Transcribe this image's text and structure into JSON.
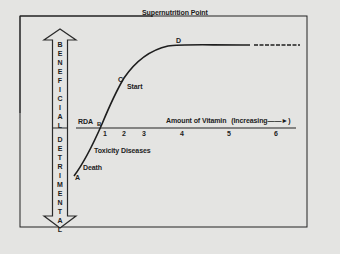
{
  "diagram": {
    "type": "vitamin dose-response curve",
    "axis_arrow": {
      "up_label": "BENEFICIAL",
      "down_label": "DETRIMENTAL"
    },
    "x_axis": {
      "label": "Amount of Vitamin",
      "direction_note": "(Increasing",
      "arrow_glyph": "——►)",
      "ticks": [
        "1",
        "2",
        "3",
        "4",
        "5",
        "6"
      ]
    },
    "rda_label": "RDA",
    "points": {
      "A": {
        "letter": "A",
        "label": "Death"
      },
      "B": {
        "letter": "B",
        "label": ""
      },
      "C": {
        "letter": "C",
        "label": "Start"
      },
      "D": {
        "letter": "D",
        "label": "Supernutrition Point"
      }
    },
    "region_label": "Toxicity Diseases",
    "colors": {
      "background": "#e4e4e2",
      "ink": "#1a1a1a"
    }
  }
}
